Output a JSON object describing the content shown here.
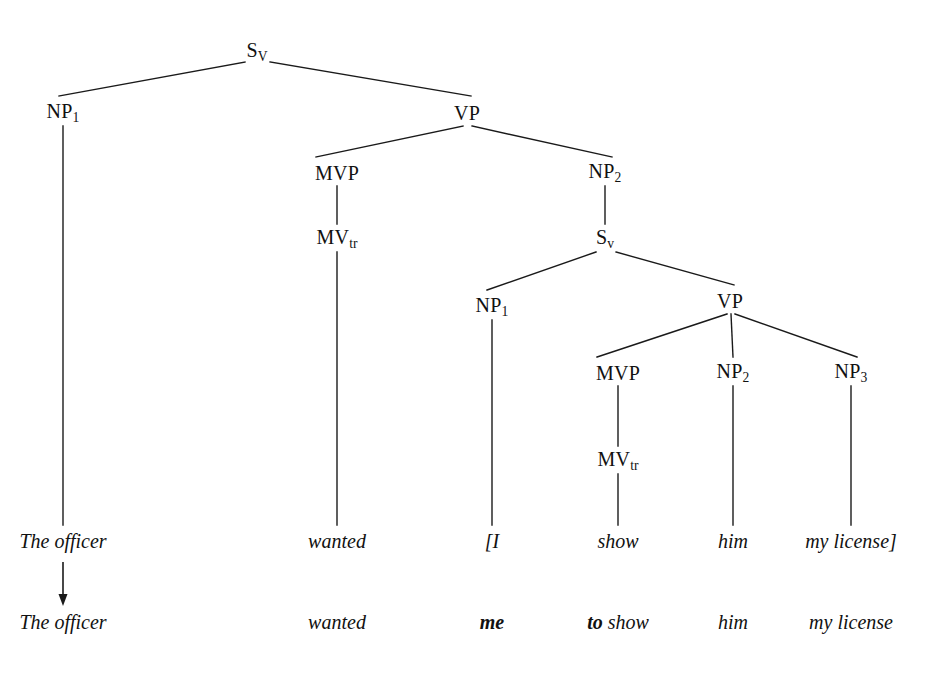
{
  "diagram": {
    "type": "syntax-tree",
    "line_color": "#1a1a1a",
    "background_color": "#ffffff",
    "text_color": "#111111"
  },
  "nodes": [
    {
      "id": "s-main",
      "label": "S",
      "sub": "V",
      "x": 257,
      "y": 52
    },
    {
      "id": "np1-main",
      "label": "NP",
      "sub": "1",
      "x": 63,
      "y": 113
    },
    {
      "id": "vp-main",
      "label": "VP",
      "sub": "",
      "x": 467,
      "y": 113
    },
    {
      "id": "mvp-main",
      "label": "MVP",
      "sub": "",
      "x": 337,
      "y": 173
    },
    {
      "id": "np2-main",
      "label": "NP",
      "sub": "2",
      "x": 605,
      "y": 173
    },
    {
      "id": "mvtr-main",
      "label": "MV",
      "sub": "tr",
      "x": 337,
      "y": 239
    },
    {
      "id": "s-embedded",
      "label": "S",
      "sub": "v",
      "x": 605,
      "y": 239
    },
    {
      "id": "np1-emb",
      "label": "NP",
      "sub": "1",
      "x": 492,
      "y": 307
    },
    {
      "id": "vp-emb",
      "label": "VP",
      "sub": "",
      "x": 730,
      "y": 301
    },
    {
      "id": "mvp-emb",
      "label": "MVP",
      "sub": "",
      "x": 618,
      "y": 373
    },
    {
      "id": "np2-emb",
      "label": "NP",
      "sub": "2",
      "x": 733,
      "y": 373
    },
    {
      "id": "np3-emb",
      "label": "NP",
      "sub": "3",
      "x": 851,
      "y": 373
    },
    {
      "id": "mvtr-emb",
      "label": "MV",
      "sub": "tr",
      "x": 618,
      "y": 461
    }
  ],
  "edges": [
    {
      "id": "s-to-np1",
      "from": "s-main",
      "to": "np1-main",
      "x1": 245,
      "y1": 62,
      "x2": 59,
      "y2": 96
    },
    {
      "id": "s-to-vp",
      "from": "s-main",
      "to": "vp-main",
      "x1": 270,
      "y1": 62,
      "x2": 471,
      "y2": 96
    },
    {
      "id": "np1-stem",
      "from": "np1-main",
      "to": "the-officer",
      "x1": 63,
      "y1": 126,
      "x2": 63,
      "y2": 525
    },
    {
      "id": "vp-to-mvp",
      "from": "vp-main",
      "to": "mvp-main",
      "x1": 463,
      "y1": 126,
      "x2": 316,
      "y2": 157
    },
    {
      "id": "vp-to-np2",
      "from": "vp-main",
      "to": "np2-main",
      "x1": 472,
      "y1": 126,
      "x2": 612,
      "y2": 157
    },
    {
      "id": "mvp-to-mvtr",
      "from": "mvp-main",
      "to": "mvtr-main",
      "x1": 337,
      "y1": 186,
      "x2": 337,
      "y2": 224
    },
    {
      "id": "mvtr-stem",
      "from": "mvtr-main",
      "to": "wanted",
      "x1": 337,
      "y1": 252,
      "x2": 337,
      "y2": 525
    },
    {
      "id": "np2-to-s",
      "from": "np2-main",
      "to": "s-embedded",
      "x1": 605,
      "y1": 186,
      "x2": 605,
      "y2": 224
    },
    {
      "id": "semb-to-np1",
      "from": "s-embedded",
      "to": "np1-emb",
      "x1": 596,
      "y1": 252,
      "x2": 487,
      "y2": 290
    },
    {
      "id": "semb-to-vp",
      "from": "s-embedded",
      "to": "vp-emb",
      "x1": 616,
      "y1": 252,
      "x2": 734,
      "y2": 285
    },
    {
      "id": "np1emb-stem",
      "from": "np1-emb",
      "to": "bracket-i",
      "x1": 492,
      "y1": 320,
      "x2": 492,
      "y2": 525
    },
    {
      "id": "vpemb-to-mvp",
      "from": "vp-emb",
      "to": "mvp-emb",
      "x1": 727,
      "y1": 314,
      "x2": 597,
      "y2": 357
    },
    {
      "id": "vpemb-to-np2",
      "from": "vp-emb",
      "to": "np2-emb",
      "x1": 731,
      "y1": 314,
      "x2": 733,
      "y2": 357
    },
    {
      "id": "vpemb-to-np3",
      "from": "vp-emb",
      "to": "np3-emb",
      "x1": 735,
      "y1": 314,
      "x2": 857,
      "y2": 357
    },
    {
      "id": "mvpemb-to-mvtr",
      "from": "mvp-emb",
      "to": "mvtr-emb",
      "x1": 618,
      "y1": 386,
      "x2": 618,
      "y2": 446
    },
    {
      "id": "mvtremb-stem",
      "from": "mvtr-emb",
      "to": "show",
      "x1": 618,
      "y1": 474,
      "x2": 618,
      "y2": 525
    },
    {
      "id": "np2emb-stem",
      "from": "np2-emb",
      "to": "him",
      "x1": 733,
      "y1": 386,
      "x2": 733,
      "y2": 525
    },
    {
      "id": "np3emb-stem",
      "from": "np3-emb",
      "to": "my-license",
      "x1": 851,
      "y1": 386,
      "x2": 851,
      "y2": 525
    }
  ],
  "terminal_row": {
    "y": 541,
    "words": [
      {
        "id": "the-officer",
        "text": "The officer",
        "x": 63,
        "bold": false
      },
      {
        "id": "wanted",
        "text": "wanted",
        "x": 337,
        "bold": false
      },
      {
        "id": "bracket-i",
        "text": "[I",
        "x": 492,
        "bold": false
      },
      {
        "id": "show",
        "text": "show",
        "x": 618,
        "bold": false
      },
      {
        "id": "him",
        "text": "him",
        "x": 733,
        "bold": false
      },
      {
        "id": "my-license",
        "text": "my license]",
        "x": 851,
        "bold": false
      }
    ]
  },
  "output_row": {
    "y": 622,
    "words": [
      {
        "id": "out-the-officer",
        "text": "The officer",
        "bold_prefix": "",
        "plain_rest": "The officer",
        "x": 63
      },
      {
        "id": "out-wanted",
        "text": "wanted",
        "bold_prefix": "",
        "plain_rest": "wanted",
        "x": 337
      },
      {
        "id": "out-me",
        "text": "me",
        "bold_prefix": "me",
        "plain_rest": "",
        "x": 492
      },
      {
        "id": "out-to-show",
        "text": "to show",
        "bold_prefix": "to ",
        "plain_rest": "show",
        "x": 618
      },
      {
        "id": "out-him",
        "text": "him",
        "bold_prefix": "",
        "plain_rest": "him",
        "x": 733
      },
      {
        "id": "out-my-license",
        "text": "my license",
        "bold_prefix": "",
        "plain_rest": "my license",
        "x": 851
      }
    ]
  },
  "derivation_arrow": {
    "id": "equi-deletion-arrow",
    "x": 63,
    "y1": 562,
    "y2": 606,
    "head_width": 9,
    "head_height": 12
  }
}
